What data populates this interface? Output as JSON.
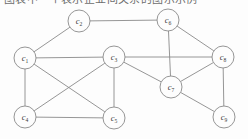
{
  "figure": {
    "caption_fragment": "图表中一个表示企业间关系的图示示例",
    "background_color": "#fdfdfd",
    "line_color": "#8a8a8a",
    "label_color": "#3a3a3a"
  },
  "graph_data": {
    "type": "node-link-diagram",
    "directed": false,
    "node_radius": 11,
    "node_count": 9,
    "edge_count": 16,
    "nodes": [
      {
        "id": "c1",
        "base": "c",
        "sub": "1",
        "x": 25,
        "y": 58
      },
      {
        "id": "c2",
        "base": "c",
        "sub": "2",
        "x": 79,
        "y": 21
      },
      {
        "id": "c3",
        "base": "c",
        "sub": "3",
        "x": 114,
        "y": 57
      },
      {
        "id": "c4",
        "base": "c",
        "sub": "4",
        "x": 25,
        "y": 117
      },
      {
        "id": "c5",
        "base": "c",
        "sub": "5",
        "x": 114,
        "y": 118
      },
      {
        "id": "c6",
        "base": "c",
        "sub": "6",
        "x": 168,
        "y": 20
      },
      {
        "id": "c7",
        "base": "c",
        "sub": "7",
        "x": 171,
        "y": 87
      },
      {
        "id": "c8",
        "base": "c",
        "sub": "8",
        "x": 223,
        "y": 57
      },
      {
        "id": "c9",
        "base": "c",
        "sub": "9",
        "x": 224,
        "y": 117
      }
    ],
    "edges": [
      {
        "source": "c1",
        "target": "c2"
      },
      {
        "source": "c1",
        "target": "c3"
      },
      {
        "source": "c1",
        "target": "c4"
      },
      {
        "source": "c1",
        "target": "c5"
      },
      {
        "source": "c2",
        "target": "c6"
      },
      {
        "source": "c3",
        "target": "c4"
      },
      {
        "source": "c3",
        "target": "c5"
      },
      {
        "source": "c3",
        "target": "c7"
      },
      {
        "source": "c3",
        "target": "c8"
      },
      {
        "source": "c4",
        "target": "c5"
      },
      {
        "source": "c6",
        "target": "c7"
      },
      {
        "source": "c6",
        "target": "c8"
      },
      {
        "source": "c7",
        "target": "c8"
      },
      {
        "source": "c7",
        "target": "c9"
      },
      {
        "source": "c8",
        "target": "c9"
      }
    ]
  }
}
